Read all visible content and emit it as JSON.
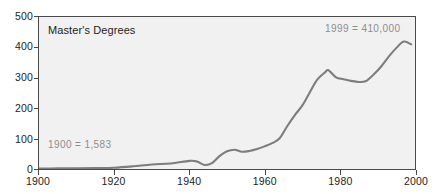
{
  "chart_data": {
    "type": "line",
    "title": "Master's Degrees",
    "xlabel": "",
    "ylabel": "",
    "xlim": [
      1900,
      2000
    ],
    "ylim": [
      0,
      500
    ],
    "grid": false,
    "legend": "none",
    "units": "thousands of degrees conferred",
    "line_color": "#7d7d7d",
    "plot_background": "#f1f1f1",
    "axis_color": "#4a4a4a",
    "annotation_color": "#8e8e8e",
    "xticks": [
      1900,
      1920,
      1940,
      1960,
      1980,
      2000
    ],
    "xtick_labels": [
      "1900",
      "1920",
      "1940",
      "1960",
      "1980",
      "2000"
    ],
    "yticks": [
      0,
      100,
      200,
      300,
      400,
      500
    ],
    "ytick_labels": [
      "0",
      "100",
      "200",
      "300",
      "400",
      "500"
    ],
    "annotations": [
      {
        "name": "start-value",
        "text": "1900  =  1,583",
        "x": 1900,
        "y": 1.583
      },
      {
        "name": "end-value",
        "text": "1999  =  410,000",
        "x": 1999,
        "y": 410
      }
    ],
    "series": [
      {
        "name": "Master's Degrees",
        "x": [
          1900,
          1905,
          1910,
          1915,
          1920,
          1925,
          1930,
          1935,
          1940,
          1942,
          1944,
          1946,
          1948,
          1950,
          1952,
          1954,
          1956,
          1958,
          1960,
          1962,
          1964,
          1966,
          1968,
          1970,
          1972,
          1974,
          1976,
          1977,
          1979,
          1981,
          1983,
          1985,
          1987,
          1989,
          1991,
          1993,
          1995,
          1997,
          1999
        ],
        "y": [
          1.6,
          2.0,
          2.1,
          3.0,
          4.3,
          8.9,
          15.0,
          18.3,
          26.7,
          24.6,
          13.4,
          19.2,
          42.4,
          58.2,
          63.5,
          56.8,
          59.3,
          65.5,
          74.4,
          84.9,
          101.1,
          140.6,
          176.7,
          208.3,
          251.6,
          293.7,
          317.2,
          325.0,
          301.1,
          295.5,
          289.9,
          286.3,
          289.3,
          310.6,
          337.2,
          369.6,
          397.6,
          419.4,
          410.0
        ]
      }
    ]
  }
}
